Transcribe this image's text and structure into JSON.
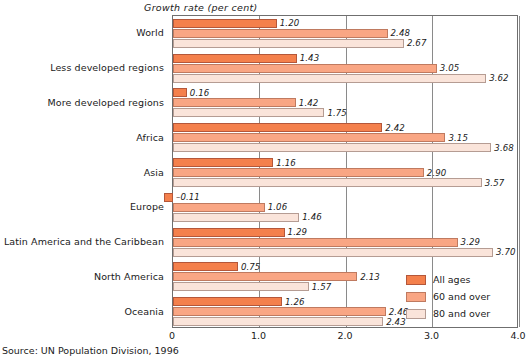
{
  "chart_data": {
    "type": "bar",
    "orientation": "horizontal",
    "title": "",
    "xlabel": "Growth rate (per cent)",
    "ylabel": "",
    "xlim": [
      0,
      4.0
    ],
    "xticks": [
      "0",
      "1.0",
      "2.0",
      "3.0",
      "4.0"
    ],
    "xtick_values": [
      0,
      1.0,
      2.0,
      3.0,
      4.0
    ],
    "grid": true,
    "legend_position": "bottom-right",
    "categories": [
      "World",
      "Less developed regions",
      "More developed regions",
      "Africa",
      "Asia",
      "Europe",
      "Latin America and the Caribbean",
      "North America",
      "Oceania"
    ],
    "series": [
      {
        "name": "All ages",
        "color": "#f4804c",
        "values": [
          1.2,
          1.43,
          0.16,
          2.42,
          1.16,
          -0.11,
          1.29,
          0.75,
          1.26
        ],
        "labels": [
          "1.20",
          "1.43",
          "0.16",
          "2.42",
          "1.16",
          "–0.11",
          "1.29",
          "0.75",
          "1.26"
        ]
      },
      {
        "name": "60 and over",
        "color": "#f9a684",
        "values": [
          2.48,
          3.05,
          1.42,
          3.15,
          2.9,
          1.06,
          3.29,
          2.13,
          2.46
        ],
        "labels": [
          "2.48",
          "3.05",
          "1.42",
          "3.15",
          "2.90",
          "1.06",
          "3.29",
          "2.13",
          "2.46"
        ]
      },
      {
        "name": "80 and over",
        "color": "#fae4da",
        "values": [
          2.67,
          3.62,
          1.75,
          3.68,
          3.57,
          1.46,
          3.7,
          1.57,
          2.43
        ],
        "labels": [
          "2.67",
          "3.62",
          "1.75",
          "3.68",
          "3.57",
          "1.46",
          "3.70",
          "1.57",
          "2.43"
        ]
      }
    ],
    "source": "Source: UN Population Division, 1996"
  },
  "legend": {
    "items": [
      {
        "label": "All ages"
      },
      {
        "label": "60 and over"
      },
      {
        "label": "80 and over"
      }
    ]
  },
  "footer": {
    "source": "Source: UN Population Division, 1996"
  }
}
